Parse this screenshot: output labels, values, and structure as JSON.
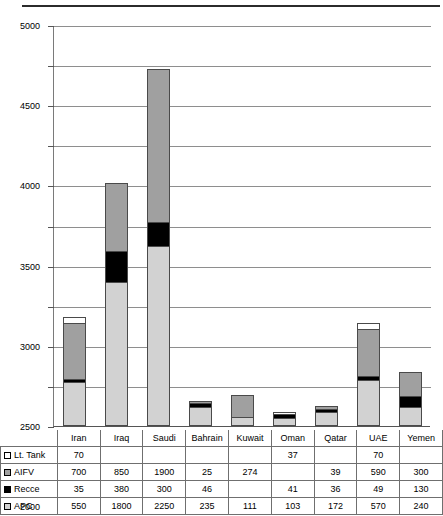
{
  "chart_data": {
    "type": "bar",
    "stacked": true,
    "title": "",
    "xlabel": "",
    "ylabel": "",
    "ylim": [
      0,
      5000
    ],
    "ytick_step": 500,
    "yticks": [
      0,
      500,
      1000,
      1500,
      2000,
      2500,
      3000,
      3500,
      4000,
      4500,
      5000
    ],
    "grid": true,
    "legend_position": "table-row-labels",
    "categories": [
      "Iran",
      "Iraq",
      "Saudi",
      "Bahrain",
      "Kuwait",
      "Oman",
      "Qatar",
      "UAE",
      "Yemen"
    ],
    "series": [
      {
        "name": "Lt. Tank",
        "color": "#ffffff",
        "values": [
          70,
          null,
          null,
          null,
          null,
          37,
          null,
          70,
          null
        ],
        "labels": [
          "70",
          "",
          "",
          "",
          "",
          "37",
          "",
          "70",
          ""
        ]
      },
      {
        "name": "AIFV",
        "color": "#a0a0a0",
        "values": [
          700,
          850,
          1900,
          25,
          274,
          null,
          39,
          590,
          300
        ],
        "labels": [
          "700",
          "850",
          "1900",
          "25",
          "274",
          "",
          "39",
          "590",
          "300"
        ]
      },
      {
        "name": "Recce",
        "color": "#000000",
        "values": [
          35,
          380,
          300,
          46,
          null,
          41,
          36,
          49,
          130
        ],
        "labels": [
          "35",
          "380",
          "300",
          "46",
          "",
          "41",
          "36",
          "49",
          "130"
        ]
      },
      {
        "name": "APC",
        "color": "#d2d2d2",
        "values": [
          550,
          1800,
          2250,
          235,
          111,
          103,
          172,
          570,
          240
        ],
        "labels": [
          "550",
          "1800",
          "2250",
          "235",
          "111",
          "103",
          "172",
          "570",
          "240"
        ]
      }
    ],
    "stack_order_bottom_to_top": [
      "APC",
      "Recce",
      "AIFV",
      "Lt. Tank"
    ],
    "totals": [
      1355,
      3030,
      4450,
      306,
      385,
      181,
      247,
      1279,
      670
    ]
  },
  "colors": {
    "lt_tank": "#ffffff",
    "aifv": "#a0a0a0",
    "recce": "#000000",
    "apc": "#d2d2d2",
    "gridline": "#8e8e8e",
    "axis": "#555555",
    "rule": "#2b2b2b"
  }
}
